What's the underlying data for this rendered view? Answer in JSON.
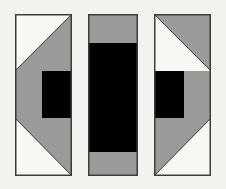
{
  "artwork": {
    "title": "Three Vertical Geometric Panels",
    "width": 226,
    "height": 189,
    "background_color": "#f2f2f0",
    "border_color": "#3c3c3c",
    "border_width": 1.5,
    "palette": {
      "white": "#f7f7f5",
      "gray": "#9a9a9a",
      "black": "#000000",
      "background": "#f2f2f0",
      "border": "#3c3c3c"
    },
    "panels": [
      {
        "name": "left-panel",
        "x": 15,
        "y": 14,
        "width": 57,
        "height": 162,
        "sections": [
          {
            "name": "top-section",
            "y": 14,
            "height": 57,
            "kind": "diagonal",
            "diagonal": "bottom-left-to-top-right",
            "fill_upper_left": "#f7f7f5",
            "fill_lower_right": "#9a9a9a"
          },
          {
            "name": "middle-section",
            "y": 71,
            "height": 47,
            "kind": "vertical-split",
            "split_x": 42,
            "fill_left": "#9a9a9a",
            "fill_right": "#000000"
          },
          {
            "name": "bottom-section",
            "y": 118,
            "height": 58,
            "kind": "diagonal",
            "diagonal": "top-left-to-bottom-right",
            "fill_upper_right": "#9a9a9a",
            "fill_lower_left": "#f7f7f5"
          }
        ]
      },
      {
        "name": "middle-panel",
        "x": 88,
        "y": 14,
        "width": 50,
        "height": 162,
        "sections": [
          {
            "name": "top-band",
            "y": 14,
            "height": 29,
            "kind": "solid",
            "fill": "#9a9a9a"
          },
          {
            "name": "center-band",
            "y": 43,
            "height": 109,
            "kind": "solid",
            "fill": "#000000"
          },
          {
            "name": "bottom-band",
            "y": 152,
            "height": 24,
            "kind": "solid",
            "fill": "#9a9a9a"
          }
        ]
      },
      {
        "name": "right-panel",
        "x": 154,
        "y": 14,
        "width": 57,
        "height": 162,
        "sections": [
          {
            "name": "top-section",
            "y": 14,
            "height": 57,
            "kind": "diagonal",
            "diagonal": "top-left-to-bottom-right",
            "fill_upper_left": "#9a9a9a",
            "fill_lower_right": "#f7f7f5"
          },
          {
            "name": "middle-section",
            "y": 71,
            "height": 47,
            "kind": "vertical-split",
            "split_x": 184,
            "fill_left": "#000000",
            "fill_right": "#9a9a9a"
          },
          {
            "name": "bottom-section",
            "y": 118,
            "height": 58,
            "kind": "diagonal",
            "diagonal": "bottom-left-to-top-right",
            "fill_upper_left": "#9a9a9a",
            "fill_lower_right": "#f7f7f5"
          }
        ]
      }
    ]
  }
}
